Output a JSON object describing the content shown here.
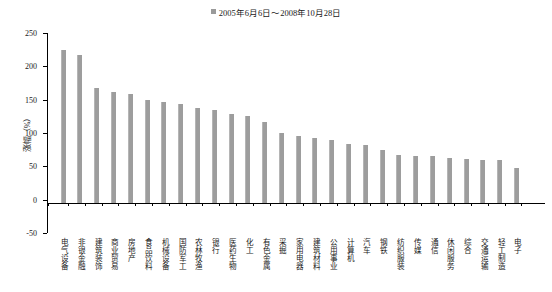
{
  "legend": {
    "label": "2005年6月6日～2008年10月28日",
    "marker_color": "#9a9a9a",
    "position": "top-center"
  },
  "chart_data": {
    "type": "bar",
    "title": "",
    "subtitle": "",
    "xlabel": "",
    "ylabel": "涨幅（%）",
    "ylim": [
      -50,
      250
    ],
    "yticks": [
      250,
      200,
      150,
      100,
      50,
      0,
      -50
    ],
    "ytick_labels": [
      "250",
      "200",
      "150",
      "100",
      "50",
      "0",
      "-50"
    ],
    "grid": false,
    "bar_color": "#9d9d9d",
    "series_name": "2005年6月6日～2008年10月28日",
    "categories": [
      "电气设备",
      "非银金融",
      "建筑装饰",
      "商业贸易",
      "房地产",
      "食品饮料",
      "机械设备",
      "国防军工",
      "农林牧渔",
      "银行",
      "医药生物",
      "化工",
      "有色金属",
      "采掘",
      "家用电器",
      "建筑材料",
      "公用事业",
      "计算机",
      "汽车",
      "钢铁",
      "纺织服装",
      "传媒",
      "通信",
      "休闲服务",
      "综合",
      "交通运输",
      "轻工制造",
      "电子"
    ],
    "values": [
      230,
      222,
      172,
      166,
      163,
      155,
      152,
      148,
      143,
      140,
      133,
      130,
      122,
      105,
      100,
      97,
      94,
      88,
      87,
      80,
      72,
      71,
      71,
      68,
      66,
      65,
      64,
      52
    ]
  }
}
